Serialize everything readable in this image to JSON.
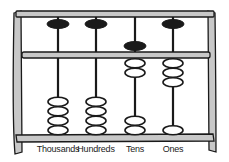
{
  "diagram": {
    "type": "abacus",
    "colors": {
      "frame_fill": "#c8c8c8",
      "outline": "#1a1a1a",
      "heaven_bead": "#1a1a1a",
      "earth_bead": "#ffffff"
    },
    "columns": [
      {
        "label": "Thousands",
        "x": 58,
        "heaven_bead_active": false,
        "earth_beads_up": 0,
        "digit": 0
      },
      {
        "label": "Hundreds",
        "x": 96,
        "heaven_bead_active": false,
        "earth_beads_up": 0,
        "digit": 0
      },
      {
        "label": "Tens",
        "x": 135,
        "heaven_bead_active": true,
        "earth_beads_up": 2,
        "digit": 7
      },
      {
        "label": "Ones",
        "x": 173,
        "heaven_bead_active": false,
        "earth_beads_up": 3,
        "digit": 3
      }
    ]
  }
}
